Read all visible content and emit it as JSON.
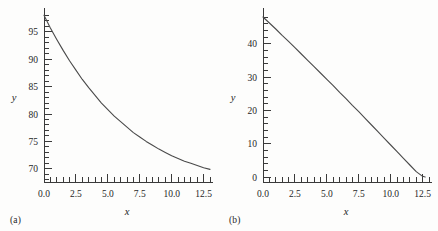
{
  "figure": {
    "background": "#fdfdfc",
    "curve_color": "#4a4a4a",
    "axis_color": "#3a3a3a"
  },
  "panels": [
    {
      "tag": "(a)"
    },
    {
      "tag": "(b)"
    }
  ],
  "chart_data": [
    {
      "type": "line",
      "title": "",
      "xlabel": "x",
      "ylabel": "y",
      "xlim": [
        0,
        13
      ],
      "ylim": [
        67.6,
        98.6
      ],
      "grid": false,
      "legend": null,
      "xticks": [
        0.0,
        2.5,
        5.0,
        7.5,
        10.0,
        12.5
      ],
      "xticklabels": [
        "0.0",
        "2.5",
        "5.0",
        "7.5",
        "10.0",
        "12.5"
      ],
      "x_minor_tick_step": 0.5,
      "yticks": [
        70,
        75,
        80,
        85,
        90,
        95
      ],
      "yticklabels": [
        "70",
        "75",
        "80",
        "85",
        "90",
        "95"
      ],
      "y_minor_tick_step": 1,
      "annotation": "exponential decay toward asymptote y = 68",
      "x": [
        0.0,
        0.5,
        1.0,
        1.5,
        2.0,
        2.5,
        3.0,
        3.5,
        4.0,
        4.5,
        5.0,
        5.5,
        6.0,
        6.5,
        7.0,
        7.5,
        8.0,
        8.5,
        9.0,
        9.5,
        10.0,
        10.5,
        11.0,
        11.5,
        12.0,
        12.5,
        13.0
      ],
      "y": [
        98.0,
        95.7,
        93.6,
        91.6,
        89.7,
        88.0,
        86.3,
        84.8,
        83.4,
        82.0,
        80.8,
        79.6,
        78.6,
        77.6,
        76.6,
        75.8,
        75.0,
        74.3,
        73.6,
        73.0,
        72.4,
        71.9,
        71.4,
        71.0,
        70.6,
        70.2,
        69.9
      ]
    },
    {
      "type": "line",
      "title": "",
      "xlabel": "x",
      "ylabel": "y",
      "xlim": [
        0,
        13
      ],
      "ylim": [
        -1.5,
        49.5
      ],
      "grid": false,
      "legend": null,
      "xticks": [
        0.0,
        2.5,
        5.0,
        7.5,
        10.0,
        12.5
      ],
      "xticklabels": [
        "0.0",
        "2.5",
        "5.0",
        "7.5",
        "10.0",
        "12.5"
      ],
      "x_minor_tick_step": 0.5,
      "yticks": [
        0,
        10,
        20,
        30,
        40
      ],
      "yticklabels": [
        "0",
        "10",
        "20",
        "30",
        "40"
      ],
      "y_minor_tick_step": 2,
      "annotation": "near-linear decline crossing zero at x ~ 12.7",
      "x": [
        0.0,
        0.5,
        1.0,
        1.5,
        2.0,
        2.5,
        3.0,
        3.5,
        4.0,
        4.5,
        5.0,
        5.5,
        6.0,
        6.5,
        7.0,
        7.5,
        8.0,
        8.5,
        9.0,
        9.5,
        10.0,
        10.5,
        11.0,
        11.5,
        12.0,
        12.5,
        12.7
      ],
      "y": [
        48.0,
        46.2,
        44.4,
        42.5,
        40.7,
        38.8,
        36.9,
        35.0,
        33.1,
        31.2,
        29.3,
        27.4,
        25.4,
        23.5,
        21.5,
        19.6,
        17.6,
        15.6,
        13.6,
        11.6,
        9.6,
        7.6,
        5.6,
        3.6,
        1.6,
        0.2,
        0.0
      ]
    }
  ]
}
